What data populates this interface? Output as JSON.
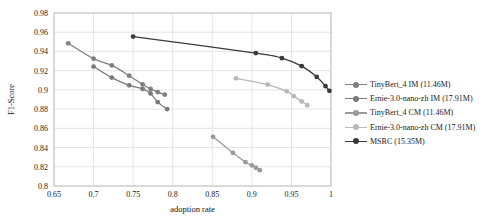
{
  "chart_data": {
    "type": "line",
    "title": "",
    "xlabel": "adoption rate",
    "ylabel": "F1-Score",
    "xlim": [
      0.65,
      1.0
    ],
    "ylim": [
      0.8,
      0.98
    ],
    "xticks": [
      "0.65",
      "0.7",
      "0.75",
      "0.8",
      "0.85",
      "0.9",
      "0.95",
      "1"
    ],
    "xtick_values": [
      0.65,
      0.7,
      0.75,
      0.8,
      0.85,
      0.9,
      0.95,
      1.0
    ],
    "yticks": [
      "0.8",
      "0.82",
      "0.84",
      "0.86",
      "0.88",
      "0.9",
      "0.92",
      "0.94",
      "0.96",
      "0.98"
    ],
    "ytick_values": [
      0.8,
      0.82,
      0.84,
      0.86,
      0.88,
      0.9,
      0.92,
      0.94,
      0.96,
      0.98
    ],
    "grid": true,
    "legend_position": "right",
    "series": [
      {
        "name": "TinyBert_4 IM (11.46M)",
        "color": "#808080",
        "x": [
          0.668,
          0.7,
          0.723,
          0.745,
          0.762,
          0.772,
          0.781,
          0.79
        ],
        "y": [
          0.9485,
          0.9325,
          0.9255,
          0.9148,
          0.9057,
          0.901,
          0.8977,
          0.895
        ]
      },
      {
        "name": "Ernie-3.0-nano-zh IM (17.91M)",
        "color": "#7a7a7a",
        "x": [
          0.7,
          0.723,
          0.745,
          0.762,
          0.772,
          0.781,
          0.793
        ],
        "y": [
          0.9243,
          0.9128,
          0.9047,
          0.901,
          0.8963,
          0.8873,
          0.88
        ]
      },
      {
        "name": "TinyBert_4 CM (11.46M)",
        "color": "#9a9a9a",
        "x": [
          0.851,
          0.876,
          0.892,
          0.9,
          0.905,
          0.91
        ],
        "y": [
          0.8512,
          0.8345,
          0.8248,
          0.8215,
          0.819,
          0.8165
        ]
      },
      {
        "name": "Ernie-3.0-nano-zh CM (17.91M)",
        "color": "#b8b8b8",
        "x": [
          0.88,
          0.92,
          0.944,
          0.953,
          0.963,
          0.97
        ],
        "y": [
          0.912,
          0.9055,
          0.8985,
          0.8935,
          0.888,
          0.884
        ]
      },
      {
        "name": "MSRC (15.35M)",
        "color": "#3a3a3a",
        "x": [
          0.75,
          0.905,
          0.938,
          0.963,
          0.982,
          0.993,
          0.998
        ],
        "y": [
          0.9555,
          0.9383,
          0.933,
          0.9247,
          0.9135,
          0.904,
          0.899
        ]
      }
    ]
  },
  "legend": {
    "items": [
      {
        "label": "TinyBert_4 IM (11.46M)",
        "color": "#808080"
      },
      {
        "label": "Ernie-3.0-nano-zh IM (17.91M)",
        "color": "#7a7a7a"
      },
      {
        "label": "TinyBert_4 CM (11.46M)",
        "color": "#9a9a9a"
      },
      {
        "label": "Ernie-3.0-nano-zh CM (17.91M)",
        "color": "#b8b8b8"
      },
      {
        "label": "MSRC (15.35M)",
        "color": "#3a3a3a"
      }
    ]
  }
}
